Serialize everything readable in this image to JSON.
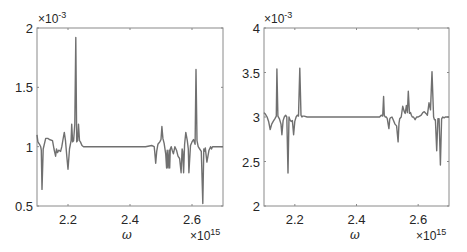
{
  "chart_data": [
    {
      "type": "line",
      "title": "",
      "xlabel": "ω",
      "ylabel": "",
      "x_multiplier": "×10^15",
      "y_multiplier": "×10^-3",
      "xlim": [
        2.1,
        2.7
      ],
      "ylim": [
        0.5,
        2.0
      ],
      "xticks": [
        2.2,
        2.4,
        2.6
      ],
      "xtick_labels": [
        "2.2",
        "2.4",
        "2.6"
      ],
      "yticks": [
        0.5,
        1.0,
        1.5,
        2.0
      ],
      "ytick_labels": [
        "0.5",
        "1",
        "1.5",
        "2"
      ],
      "grid": false,
      "series": [
        {
          "name": "left",
          "color": "#707070",
          "x": [
            2.1,
            2.103,
            2.108,
            2.112,
            2.114,
            2.116,
            2.12,
            2.128,
            2.135,
            2.14,
            2.15,
            2.155,
            2.16,
            2.163,
            2.166,
            2.17,
            2.176,
            2.18,
            2.184,
            2.188,
            2.192,
            2.196,
            2.2,
            2.205,
            2.21,
            2.212,
            2.215,
            2.218,
            2.222,
            2.225,
            2.228,
            2.231,
            2.234,
            2.237,
            2.24,
            2.245,
            2.25,
            2.26,
            2.3,
            2.35,
            2.4,
            2.45,
            2.47,
            2.478,
            2.48,
            2.483,
            2.486,
            2.49,
            2.496,
            2.5,
            2.503,
            2.506,
            2.51,
            2.515,
            2.518,
            2.52,
            2.523,
            2.526,
            2.528,
            2.53,
            2.533,
            2.536,
            2.54,
            2.545,
            2.55,
            2.555,
            2.56,
            2.565,
            2.568,
            2.57,
            2.573,
            2.576,
            2.58,
            2.585,
            2.588,
            2.59,
            2.595,
            2.6,
            2.605,
            2.61,
            2.613,
            2.616,
            2.62,
            2.625,
            2.63,
            2.635,
            2.638,
            2.64,
            2.643,
            2.648,
            2.655,
            2.66,
            2.663,
            2.666,
            2.67,
            2.675,
            2.678,
            2.681,
            2.685,
            2.69,
            2.695,
            2.7
          ],
          "y": [
            1.1,
            1.04,
            1.02,
            1.0,
            0.97,
            0.64,
            0.98,
            1.07,
            1.07,
            1.06,
            1.05,
            0.98,
            0.92,
            0.98,
            0.95,
            0.97,
            0.96,
            1.0,
            1.06,
            1.12,
            1.05,
            0.92,
            0.81,
            0.98,
            1.05,
            1.19,
            1.04,
            1.05,
            1.19,
            1.92,
            1.04,
            1.05,
            1.19,
            1.05,
            1.04,
            1.01,
            1.0,
            1.0,
            1.0,
            1.0,
            1.0,
            1.0,
            1.01,
            1.0,
            0.95,
            0.86,
            0.96,
            1.02,
            1.04,
            1.06,
            1.17,
            1.07,
            1.03,
            0.94,
            0.82,
            0.97,
            0.82,
            0.97,
            0.82,
            0.98,
            1.0,
            0.97,
            0.94,
            1.0,
            0.97,
            0.92,
            0.9,
            0.78,
            0.98,
            0.96,
            0.78,
            1.02,
            1.12,
            1.05,
            0.98,
            0.78,
            1.01,
            1.04,
            1.06,
            1.02,
            1.65,
            1.05,
            1.0,
            0.98,
            0.96,
            0.52,
            0.98,
            0.96,
            0.99,
            0.87,
            0.97,
            1.0,
            0.98,
            1.0,
            1.0,
            1.0,
            1.0,
            1.0,
            1.0,
            1.0,
            1.0,
            1.0
          ]
        }
      ]
    },
    {
      "type": "line",
      "title": "",
      "xlabel": "ω",
      "ylabel": "",
      "x_multiplier": "×10^15",
      "y_multiplier": "×10^-3",
      "xlim": [
        2.1,
        2.7
      ],
      "ylim": [
        2.0,
        4.0
      ],
      "xticks": [
        2.2,
        2.4,
        2.6
      ],
      "xtick_labels": [
        "2.2",
        "2.4",
        "2.6"
      ],
      "yticks": [
        2.0,
        2.5,
        3.0,
        3.5,
        4.0
      ],
      "ytick_labels": [
        "2",
        "2.5",
        "3",
        "3.5",
        "4"
      ],
      "grid": false,
      "series": [
        {
          "name": "right",
          "color": "#707070",
          "x": [
            2.1,
            2.105,
            2.11,
            2.115,
            2.12,
            2.125,
            2.13,
            2.135,
            2.14,
            2.142,
            2.145,
            2.15,
            2.155,
            2.158,
            2.162,
            2.166,
            2.17,
            2.174,
            2.178,
            2.181,
            2.184,
            2.188,
            2.192,
            2.196,
            2.2,
            2.204,
            2.208,
            2.212,
            2.216,
            2.22,
            2.223,
            2.226,
            2.23,
            2.24,
            2.25,
            2.3,
            2.35,
            2.4,
            2.45,
            2.475,
            2.48,
            2.485,
            2.488,
            2.49,
            2.493,
            2.497,
            2.5,
            2.505,
            2.508,
            2.51,
            2.515,
            2.52,
            2.525,
            2.53,
            2.535,
            2.538,
            2.54,
            2.545,
            2.55,
            2.555,
            2.558,
            2.562,
            2.565,
            2.568,
            2.572,
            2.575,
            2.578,
            2.581,
            2.585,
            2.59,
            2.595,
            2.6,
            2.605,
            2.61,
            2.615,
            2.62,
            2.625,
            2.63,
            2.635,
            2.64,
            2.645,
            2.65,
            2.653,
            2.656,
            2.66,
            2.664,
            2.668,
            2.672,
            2.676,
            2.68,
            2.684,
            2.688,
            2.692,
            2.696,
            2.7
          ],
          "y": [
            3.05,
            3.03,
            3.0,
            2.95,
            2.86,
            2.92,
            2.95,
            2.98,
            3.01,
            3.54,
            3.01,
            2.98,
            2.92,
            2.8,
            2.96,
            3.0,
            3.02,
            3.0,
            2.37,
            3.0,
            2.97,
            2.95,
            2.96,
            2.8,
            2.95,
            3.0,
            3.02,
            3.01,
            3.55,
            3.02,
            3.0,
            3.01,
            3.01,
            3.0,
            3.0,
            3.0,
            3.0,
            3.0,
            3.0,
            3.0,
            3.02,
            3.01,
            3.23,
            3.02,
            3.0,
            3.0,
            2.98,
            2.87,
            2.98,
            2.99,
            3.0,
            2.96,
            2.92,
            2.9,
            2.72,
            2.93,
            2.98,
            3.0,
            3.12,
            3.06,
            3.04,
            3.13,
            3.05,
            3.29,
            3.04,
            3.05,
            3.02,
            3.0,
            3.0,
            2.97,
            3.0,
            3.0,
            3.01,
            3.02,
            3.05,
            3.06,
            3.04,
            3.02,
            3.16,
            3.08,
            3.51,
            3.0,
            2.97,
            2.97,
            2.62,
            2.98,
            2.98,
            2.46,
            2.98,
            3.0,
            2.99,
            3.0,
            3.0,
            3.0,
            3.0
          ]
        }
      ]
    }
  ]
}
